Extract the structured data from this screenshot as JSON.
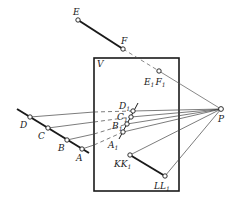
{
  "figure": {
    "plane_label": "V",
    "colors": {
      "stroke": "#1a1a1a",
      "thin": "#333333",
      "background": "#ffffff"
    },
    "plane": {
      "x": 94,
      "y": 58,
      "width": 85,
      "height": 133
    },
    "center_of_projection": {
      "label": "P",
      "x": 221,
      "y": 109
    },
    "segments": [
      {
        "name": "EF",
        "from": "E",
        "to": "F",
        "style": "thick"
      },
      {
        "name": "DA",
        "from": "D",
        "to": "A",
        "style": "thick"
      },
      {
        "name": "KL",
        "from": "KK1",
        "to": "LL1",
        "style": "thick"
      }
    ],
    "points": [
      {
        "id": "E",
        "label": "E",
        "sub": "",
        "x": 78,
        "y": 20,
        "lx": 73,
        "ly": 15
      },
      {
        "id": "F",
        "label": "F",
        "sub": "",
        "x": 123,
        "y": 49,
        "lx": 121,
        "ly": 44
      },
      {
        "id": "E1F1",
        "label": "E",
        "sub": "1",
        "label2": "F",
        "sub2": "1",
        "x": 159,
        "y": 71,
        "lx": 144,
        "ly": 85
      },
      {
        "id": "D",
        "label": "D",
        "sub": "",
        "x": 30,
        "y": 117,
        "lx": 20,
        "ly": 127
      },
      {
        "id": "C",
        "label": "C",
        "sub": "",
        "x": 48,
        "y": 128,
        "lx": 38,
        "ly": 138
      },
      {
        "id": "B",
        "label": "B",
        "sub": "",
        "x": 67,
        "y": 140,
        "lx": 57,
        "ly": 150
      },
      {
        "id": "A",
        "label": "A",
        "sub": "",
        "x": 82,
        "y": 149,
        "lx": 75,
        "ly": 160
      },
      {
        "id": "D1",
        "label": "D",
        "sub": "1",
        "x": 133,
        "y": 111,
        "lx": 118,
        "ly": 108
      },
      {
        "id": "C1",
        "label": "C",
        "sub": "1",
        "x": 131,
        "y": 117,
        "lx": 116,
        "ly": 119
      },
      {
        "id": "B1",
        "label": "B",
        "sub": "1",
        "x": 127,
        "y": 124,
        "lx": 111,
        "ly": 129
      },
      {
        "id": "A1",
        "label": "A",
        "sub": "1",
        "x": 123,
        "y": 132,
        "lx": 108,
        "ly": 148
      },
      {
        "id": "KK1",
        "label": "KK",
        "sub": "1",
        "x": 130,
        "y": 155,
        "lx": 114,
        "ly": 168
      },
      {
        "id": "LL1",
        "label": "LL",
        "sub": "1",
        "x": 165,
        "y": 176,
        "lx": 154,
        "ly": 189
      }
    ]
  }
}
